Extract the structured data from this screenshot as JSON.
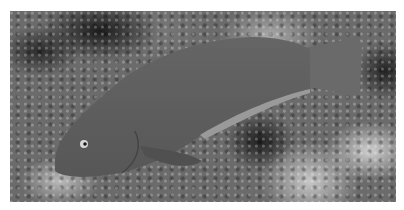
{
  "image": {
    "subject": "fish",
    "description": "Grayscale photograph of a parrotfish-like fish swimming left over a mottled coral reef",
    "colors": {
      "border": "#ffffff",
      "fish": "#5e5e5e",
      "fish_belly": "#8a8a8a",
      "background_mid": "#6b6b6b"
    }
  }
}
